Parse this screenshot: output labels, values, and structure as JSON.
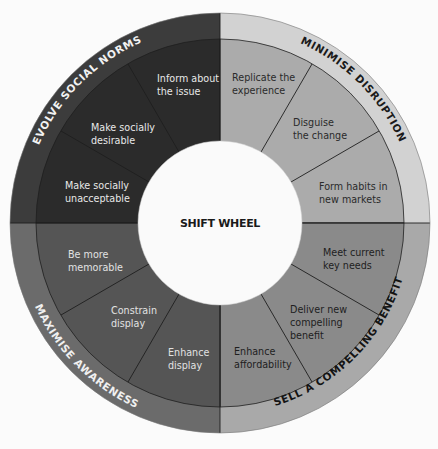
{
  "title": "SHIFT WHEEL",
  "colors": {
    "background": "#fbfbfb",
    "center_fill": "#fafafa",
    "divider": "#1e1e1e"
  },
  "quadrants": [
    {
      "id": "evolve-social-norms",
      "ring_label": "EVOLVE SOCIAL NORMS",
      "ring_color": "#3c3c3c",
      "fill_color": "#2b2b2b",
      "text_color": "#e8e8e8",
      "ring_text_color": "#f2f2f2",
      "segments": [
        {
          "label_line1": "Inform about",
          "label_line2": "the issue"
        },
        {
          "label_line1": "Make socially",
          "label_line2": "desirable"
        },
        {
          "label_line1": "Make socially",
          "label_line2": "unacceptable"
        }
      ]
    },
    {
      "id": "minimise-disruption",
      "ring_label": "MINIMISE DISRUPTION",
      "ring_color": "#d2d2d2",
      "fill_color": "#ababab",
      "text_color": "#2a2a2a",
      "ring_text_color": "#1a1a1a",
      "segments": [
        {
          "label_line1": "Replicate the",
          "label_line2": "experience"
        },
        {
          "label_line1": "Disguise",
          "label_line2": "the change"
        },
        {
          "label_line1": "Form habits in",
          "label_line2": "new markets"
        }
      ]
    },
    {
      "id": "sell-a-compelling-benefit",
      "ring_label": "SELL A COMPELLING BENEFIT",
      "ring_color": "#a9a9a9",
      "fill_color": "#8a8a8a",
      "text_color": "#1e1e1e",
      "ring_text_color": "#141414",
      "segments": [
        {
          "label_line1": "Meet current",
          "label_line2": "key needs"
        },
        {
          "label_line1": "Deliver new",
          "label_line2": "compelling",
          "label_line3": "benefit"
        },
        {
          "label_line1": "Enhance",
          "label_line2": "affordability"
        }
      ]
    },
    {
      "id": "maximise-awareness",
      "ring_label": "MAXIMISE AWARENESS",
      "ring_color": "#6b6b6b",
      "fill_color": "#555555",
      "text_color": "#e2e2e2",
      "ring_text_color": "#f0f0f0",
      "segments": [
        {
          "label_line1": "Enhance",
          "label_line2": "display"
        },
        {
          "label_line1": "Constrain",
          "label_line2": "display"
        },
        {
          "label_line1": "Be more",
          "label_line2": "memorable"
        }
      ]
    }
  ]
}
